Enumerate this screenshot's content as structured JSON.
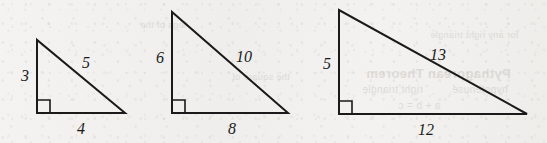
{
  "figure": {
    "background_color": "#f2f1ef",
    "line_color": "#1a1a1a"
  },
  "ghost_text": {
    "items": [
      {
        "text": "Pythagorean Theorem",
        "x": 366,
        "y": 66,
        "size": 13,
        "weight": "700"
      },
      {
        "text": "right triangle",
        "x": 362,
        "y": 84,
        "size": 10,
        "weight": "400"
      },
      {
        "text": "hypotenuse",
        "x": 452,
        "y": 84,
        "size": 10,
        "weight": "400"
      },
      {
        "text": "a  + b  = c",
        "x": 398,
        "y": 100,
        "size": 10,
        "weight": "400"
      },
      {
        "text": "for any right triangle",
        "x": 430,
        "y": 30,
        "size": 9,
        "weight": "400"
      },
      {
        "text": "the square of",
        "x": 232,
        "y": 72,
        "size": 9,
        "weight": "400"
      },
      {
        "text": "legs of the",
        "x": 140,
        "y": 20,
        "size": 9,
        "weight": "400"
      }
    ]
  },
  "triangles": [
    {
      "name": "triangle-3-4-5",
      "apex": {
        "x": 37,
        "y": 40
      },
      "right_angle_corner": {
        "x": 37,
        "y": 113
      },
      "far_corner": {
        "x": 125,
        "y": 113
      },
      "right_angle_marker_size": 13,
      "labels": {
        "vertical_leg": {
          "text": "3",
          "x": 25,
          "y": 76
        },
        "hypotenuse": {
          "text": "5",
          "x": 86,
          "y": 63
        },
        "base": {
          "text": "4",
          "x": 81,
          "y": 129
        }
      }
    },
    {
      "name": "triangle-6-8-10",
      "apex": {
        "x": 172,
        "y": 12
      },
      "right_angle_corner": {
        "x": 172,
        "y": 113
      },
      "far_corner": {
        "x": 288,
        "y": 113
      },
      "right_angle_marker_size": 13,
      "labels": {
        "vertical_leg": {
          "text": "6",
          "x": 160,
          "y": 58
        },
        "hypotenuse": {
          "text": "10",
          "x": 244,
          "y": 57
        },
        "base": {
          "text": "8",
          "x": 232,
          "y": 129
        }
      }
    },
    {
      "name": "triangle-5-12-13",
      "apex": {
        "x": 339,
        "y": 10
      },
      "right_angle_corner": {
        "x": 339,
        "y": 114
      },
      "far_corner": {
        "x": 527,
        "y": 114
      },
      "right_angle_marker_size": 13,
      "labels": {
        "vertical_leg": {
          "text": "5",
          "x": 327,
          "y": 64
        },
        "hypotenuse": {
          "text": "13",
          "x": 438,
          "y": 55
        },
        "base": {
          "text": "12",
          "x": 426,
          "y": 130
        }
      }
    }
  ]
}
